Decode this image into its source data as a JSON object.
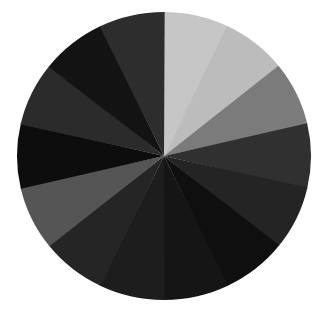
{
  "canvas": {
    "width": 327,
    "height": 312,
    "background_color": "#ffffff"
  },
  "figure": {
    "title": "",
    "shape": "circle",
    "center_x": 164,
    "center_y": 156,
    "radius_x": 147,
    "radius_y": 144,
    "sector_count": 14
  },
  "chart_data": {
    "type": "pie",
    "title": "",
    "subtitle": "",
    "xlabel": "",
    "ylabel": "",
    "legend_position": "none",
    "grid": false,
    "labels_shown": false,
    "center": [
      164,
      156
    ],
    "radius": [
      147,
      144
    ],
    "background_color": "#ffffff",
    "categories": [
      "sector-01",
      "sector-02",
      "sector-03",
      "sector-04",
      "sector-05",
      "sector-06",
      "sector-07",
      "sector-08",
      "sector-09",
      "sector-10",
      "sector-11",
      "sector-12",
      "sector-13",
      "sector-14"
    ],
    "values": [
      25.7,
      25.7,
      25.7,
      25.7,
      25.7,
      25.7,
      25.7,
      25.7,
      25.7,
      25.7,
      25.7,
      25.7,
      25.7,
      25.7
    ],
    "colors": [
      "#c6c6c6",
      "#bcbcbc",
      "#7b7b7b",
      "#303030",
      "#242424",
      "#0f0f0f",
      "#151515",
      "#1d1d1d",
      "#252525",
      "#555555",
      "#0d0d0d",
      "#2b2b2b",
      "#131313",
      "#2d2d2d"
    ],
    "sectors": [
      {
        "name": "sector-01",
        "start_angle": 0,
        "end_angle": 25.7,
        "color": "#c6c6c6",
        "tone": "light-gray"
      },
      {
        "name": "sector-02",
        "start_angle": 25.7,
        "end_angle": 51.4,
        "color": "#bcbcbc",
        "tone": "light-gray"
      },
      {
        "name": "sector-03",
        "start_angle": 51.4,
        "end_angle": 77.1,
        "color": "#7b7b7b",
        "tone": "mid-gray"
      },
      {
        "name": "sector-04",
        "start_angle": 77.1,
        "end_angle": 102.9,
        "color": "#303030",
        "tone": "dark-gray"
      },
      {
        "name": "sector-05",
        "start_angle": 102.9,
        "end_angle": 128.6,
        "color": "#242424",
        "tone": "dark-gray"
      },
      {
        "name": "sector-06",
        "start_angle": 128.6,
        "end_angle": 154.3,
        "color": "#0f0f0f",
        "tone": "near-black"
      },
      {
        "name": "sector-07",
        "start_angle": 154.3,
        "end_angle": 180.0,
        "color": "#151515",
        "tone": "near-black"
      },
      {
        "name": "sector-08",
        "start_angle": 180.0,
        "end_angle": 205.7,
        "color": "#1d1d1d",
        "tone": "near-black"
      },
      {
        "name": "sector-09",
        "start_angle": 205.7,
        "end_angle": 231.4,
        "color": "#252525",
        "tone": "dark-gray"
      },
      {
        "name": "sector-10",
        "start_angle": 231.4,
        "end_angle": 257.1,
        "color": "#555555",
        "tone": "mid-gray"
      },
      {
        "name": "sector-11",
        "start_angle": 257.1,
        "end_angle": 282.9,
        "color": "#0d0d0d",
        "tone": "near-black"
      },
      {
        "name": "sector-12",
        "start_angle": 282.9,
        "end_angle": 308.6,
        "color": "#2b2b2b",
        "tone": "dark-gray"
      },
      {
        "name": "sector-13",
        "start_angle": 308.6,
        "end_angle": 334.3,
        "color": "#131313",
        "tone": "near-black"
      },
      {
        "name": "sector-14",
        "start_angle": 334.3,
        "end_angle": 360.0,
        "color": "#2d2d2d",
        "tone": "dark-gray"
      }
    ]
  }
}
